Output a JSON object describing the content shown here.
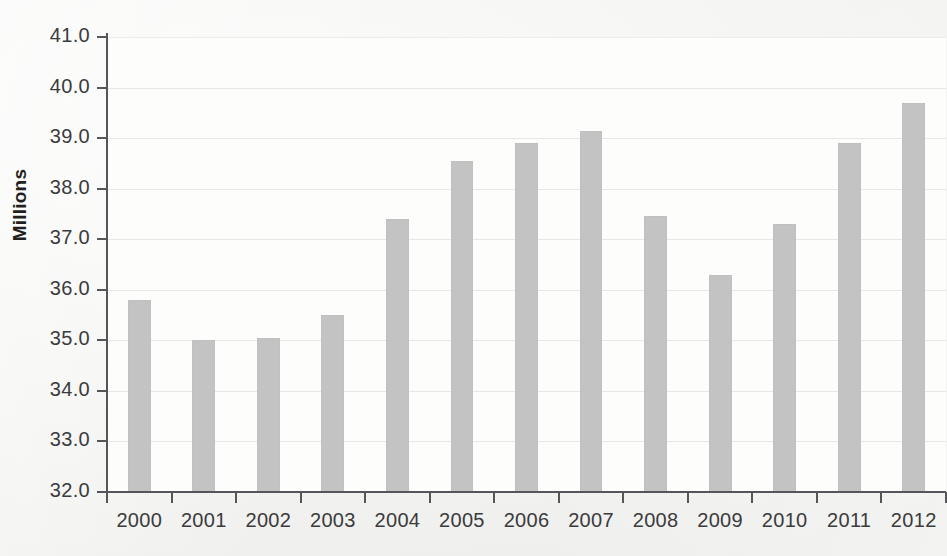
{
  "chart_data": {
    "type": "bar",
    "title": "",
    "subtitle": "",
    "xlabel": "",
    "ylabel": "Millions",
    "categories": [
      "2000",
      "2001",
      "2002",
      "2003",
      "2004",
      "2005",
      "2006",
      "2007",
      "2008",
      "2009",
      "2010",
      "2011",
      "2012"
    ],
    "values": [
      35.8,
      35.0,
      35.05,
      35.5,
      37.4,
      38.55,
      38.9,
      39.15,
      37.45,
      36.3,
      37.3,
      38.9,
      39.7
    ],
    "ylim": [
      32.0,
      41.0
    ],
    "ytick_labels": [
      "41.0",
      "40.0",
      "39.0",
      "38.0",
      "37.0",
      "36.0",
      "35.0",
      "34.0",
      "33.0",
      "32.0"
    ],
    "ytick_values": [
      41.0,
      40.0,
      39.0,
      38.0,
      37.0,
      36.0,
      35.0,
      34.0,
      33.0,
      32.0
    ],
    "grid": true,
    "legend": null,
    "legend_position": "none",
    "series": [
      {
        "name": "Millions",
        "values": [
          35.8,
          35.0,
          35.05,
          35.5,
          37.4,
          38.55,
          38.9,
          39.15,
          37.45,
          36.3,
          37.3,
          38.9,
          39.7
        ]
      }
    ],
    "colors": {
      "bar_fill": "#c3c3c3",
      "axis": "#56565a",
      "grid": "#e7e7e5",
      "plot_background": "#fdfdfc",
      "page_background": "#f3f3f1",
      "tick_text": "#3b3b3d",
      "axis_title": "#231f20"
    }
  }
}
